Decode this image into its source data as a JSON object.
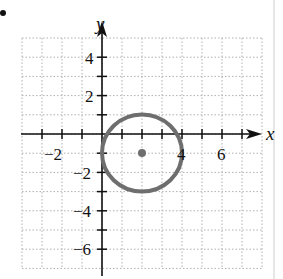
{
  "chart_data": {
    "type": "scatter",
    "title": "",
    "xlabel": "x",
    "ylabel": "y",
    "xlim": [
      -4,
      8
    ],
    "ylim": [
      -7,
      5
    ],
    "grid": true,
    "x_tick_labels": [
      "-2",
      "4",
      "6"
    ],
    "y_tick_labels": [
      "4",
      "2",
      "-2",
      "-4",
      "-6"
    ],
    "x_ticks": [
      -3,
      -2,
      -1,
      1,
      2,
      3,
      4,
      5,
      6,
      7
    ],
    "y_ticks": [
      4,
      3,
      2,
      1,
      -1,
      -2,
      -3,
      -4,
      -5,
      -6
    ],
    "shapes": [
      {
        "type": "circle",
        "center": [
          2,
          -1
        ],
        "radius": 2,
        "color": "#707070"
      }
    ],
    "points": [
      {
        "x": 2,
        "y": -1,
        "label": "center",
        "color": "#707070"
      }
    ]
  },
  "labels": {
    "x_axis": "x",
    "y_axis": "y",
    "tick_neg2_x": "−2",
    "tick_4_x": "4",
    "tick_6_x": "6",
    "tick_4_y": "4",
    "tick_2_y": "2",
    "tick_neg2_y": "−2",
    "tick_neg4_y": "−4",
    "tick_neg6_y": "−6"
  },
  "colors": {
    "grid": "#b0b0b0",
    "axis": "#111111",
    "circle": "#6e6e6e"
  }
}
